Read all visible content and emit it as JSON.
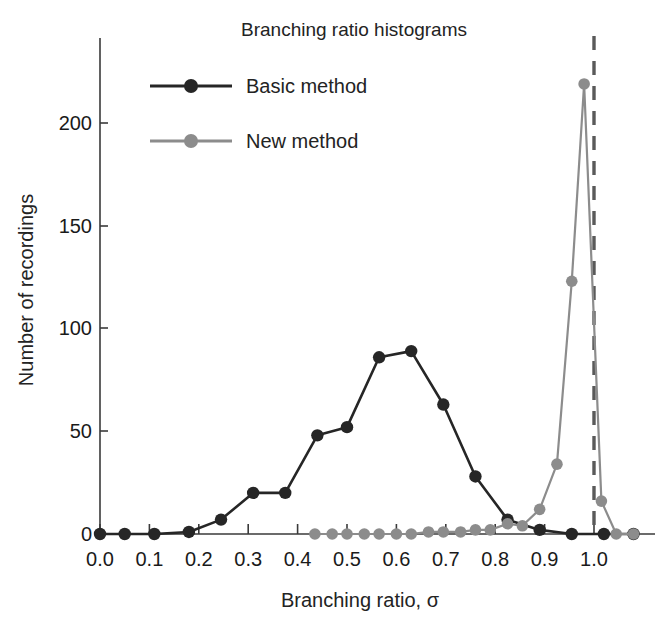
{
  "figure": {
    "title": "Branching ratio histograms",
    "xlabel": "Branching ratio, σ",
    "ylabel": "Number of recordings"
  },
  "legend": {
    "position": "top-left-inside",
    "entries": [
      {
        "label": "Basic method",
        "color": "#262626",
        "marker": "circle"
      },
      {
        "label": "New method",
        "color": "#8c8c8c",
        "marker": "circle"
      }
    ]
  },
  "axes": {
    "x_ticks": [
      "0.0",
      "0.1",
      "0.2",
      "0.3",
      "0.4",
      "0.5",
      "0.6",
      "0.7",
      "0.8",
      "0.9",
      "1.0"
    ],
    "x_tick_values": [
      0.0,
      0.1,
      0.2,
      0.3,
      0.4,
      0.5,
      0.6,
      0.7,
      0.8,
      0.9,
      1.0
    ],
    "y_ticks": [
      "0",
      "50",
      "100",
      "150",
      "200"
    ],
    "y_tick_values": [
      0,
      50,
      100,
      150,
      200
    ],
    "xlim": [
      -0.02,
      1.09
    ],
    "ylim": [
      -4,
      235
    ],
    "grid": false
  },
  "annotations": [
    {
      "type": "vline",
      "x": 1.0,
      "style": "dashed",
      "color": "#5a5a5a",
      "width": 3
    }
  ],
  "chart_data": {
    "type": "line",
    "title": "Branching ratio histograms",
    "xlabel": "Branching ratio, σ",
    "ylabel": "Number of recordings",
    "xlim": [
      -0.02,
      1.09
    ],
    "ylim": [
      -4,
      235
    ],
    "grid": false,
    "legend_position": "top-left-inside",
    "series": [
      {
        "name": "Basic method",
        "color": "#262626",
        "x": [
          0.0,
          0.05,
          0.11,
          0.18,
          0.245,
          0.31,
          0.375,
          0.44,
          0.5,
          0.565,
          0.63,
          0.695,
          0.76,
          0.825,
          0.89,
          0.955,
          1.02,
          1.08
        ],
        "y": [
          0,
          0,
          0,
          1,
          7,
          20,
          20,
          48,
          52,
          86,
          89,
          63,
          28,
          7,
          2,
          0,
          0,
          0
        ]
      },
      {
        "name": "New method",
        "color": "#8c8c8c",
        "x": [
          0.435,
          0.47,
          0.5,
          0.535,
          0.565,
          0.6,
          0.63,
          0.665,
          0.695,
          0.73,
          0.76,
          0.79,
          0.825,
          0.855,
          0.89,
          0.925,
          0.955,
          0.98,
          1.015,
          1.045,
          1.08
        ],
        "y": [
          0,
          0,
          0,
          0,
          0,
          0,
          0,
          1,
          1,
          1,
          2,
          2,
          5,
          4,
          12,
          34,
          123,
          219,
          16,
          0,
          0
        ]
      }
    ]
  }
}
